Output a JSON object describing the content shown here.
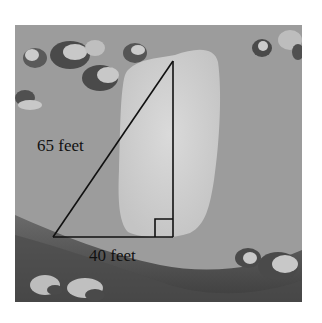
{
  "figure": {
    "labels": {
      "hypotenuse": "65 feet",
      "base": "40 feet"
    },
    "triangle": {
      "apex": [
        173,
        61
      ],
      "right_angle_vertex": [
        173,
        237
      ],
      "left_vertex": [
        53,
        237
      ],
      "right_angle_marker_size": 18
    },
    "colors": {
      "sky": "#9b9b9b",
      "monolith": "#d2d2d2",
      "ground_dark": "#555555",
      "cloud_dark": "#4a4a4a",
      "cloud_light": "#c8c8c8",
      "line": "#111111",
      "background": "#ffffff"
    }
  }
}
